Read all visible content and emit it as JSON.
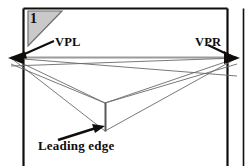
{
  "figure": {
    "panel_number": "1",
    "labels": {
      "vanishing_point_left": "VPL",
      "vanishing_point_right": "VPR",
      "leading_edge": "Leading edge"
    },
    "colors": {
      "ink": "#100d0c",
      "frame": "#100d0c",
      "horizon_line": "#8f8f8f",
      "construction_line": "#6a6a6a",
      "corner_tab_fill": "#c9c9c9",
      "corner_tab_stroke": "#6f6f6f",
      "page_background": "#ffffff"
    },
    "geometry": {
      "vanishing_point_left": [
        11,
        57
      ],
      "vanishing_point_right": [
        237,
        57
      ],
      "leading_edge_top": [
        105,
        103
      ],
      "leading_edge_bottom": [
        105,
        131
      ],
      "inner_frame": [
        23,
        8,
        228,
        166
      ],
      "outer_rule_x": 243
    }
  }
}
